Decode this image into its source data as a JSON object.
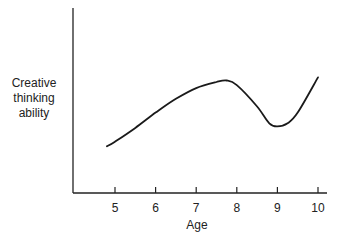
{
  "chart_data": {
    "type": "line",
    "title": "",
    "xlabel": "Age",
    "ylabel": "Creative thinking ability",
    "ylabel_lines": [
      "Creative",
      "thinking",
      "ability"
    ],
    "x_ticks": [
      5,
      6,
      7,
      8,
      9,
      10
    ],
    "xlim": [
      4.0,
      10.2
    ],
    "y_ticks": [],
    "ylim": [
      0,
      10
    ],
    "grid": false,
    "legend": null,
    "series": [
      {
        "name": "Creative thinking ability",
        "x": [
          4.8,
          5.0,
          5.5,
          6.0,
          6.5,
          7.0,
          7.5,
          7.75,
          8.0,
          8.5,
          8.8,
          9.0,
          9.25,
          9.5,
          10.0
        ],
        "values": [
          2.4,
          2.7,
          3.6,
          4.6,
          5.5,
          6.2,
          6.6,
          6.7,
          6.4,
          5.0,
          3.9,
          3.7,
          3.9,
          4.6,
          6.9
        ]
      }
    ]
  }
}
